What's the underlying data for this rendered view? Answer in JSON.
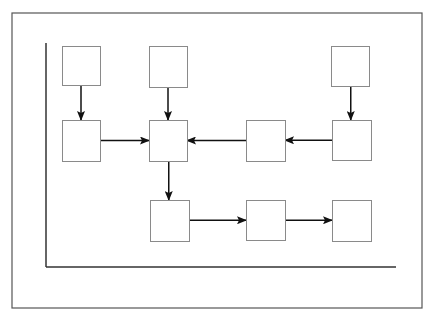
{
  "diagram": {
    "type": "flowchart",
    "frame": {
      "x": 12,
      "y": 13,
      "w": 410,
      "h": 295,
      "stroke": "#555555"
    },
    "axes": {
      "origin": [
        46,
        267
      ],
      "top": 43,
      "right": 396,
      "stroke": "#333333"
    },
    "box_stroke": "#8a8a8a",
    "arrow_color": "#111111",
    "nodes": [
      {
        "id": "A",
        "x": 62,
        "y": 46,
        "w": 38,
        "h": 39,
        "label": ""
      },
      {
        "id": "B",
        "x": 149,
        "y": 46,
        "w": 38,
        "h": 41,
        "label": ""
      },
      {
        "id": "C",
        "x": 331,
        "y": 46,
        "w": 38,
        "h": 40,
        "label": ""
      },
      {
        "id": "D",
        "x": 62,
        "y": 120,
        "w": 38,
        "h": 41,
        "label": ""
      },
      {
        "id": "E",
        "x": 149,
        "y": 120,
        "w": 38,
        "h": 41,
        "label": ""
      },
      {
        "id": "F",
        "x": 246,
        "y": 120,
        "w": 39,
        "h": 41,
        "label": ""
      },
      {
        "id": "G",
        "x": 332,
        "y": 120,
        "w": 39,
        "h": 40,
        "label": ""
      },
      {
        "id": "H",
        "x": 150,
        "y": 200,
        "w": 39,
        "h": 41,
        "label": ""
      },
      {
        "id": "I",
        "x": 246,
        "y": 200,
        "w": 39,
        "h": 40,
        "label": ""
      },
      {
        "id": "J",
        "x": 332,
        "y": 200,
        "w": 39,
        "h": 41,
        "label": ""
      }
    ],
    "edges": [
      {
        "from": "A",
        "to": "D"
      },
      {
        "from": "B",
        "to": "E"
      },
      {
        "from": "C",
        "to": "G"
      },
      {
        "from": "D",
        "to": "E"
      },
      {
        "from": "F",
        "to": "E"
      },
      {
        "from": "G",
        "to": "F"
      },
      {
        "from": "E",
        "to": "H"
      },
      {
        "from": "H",
        "to": "I"
      },
      {
        "from": "I",
        "to": "J"
      }
    ]
  }
}
